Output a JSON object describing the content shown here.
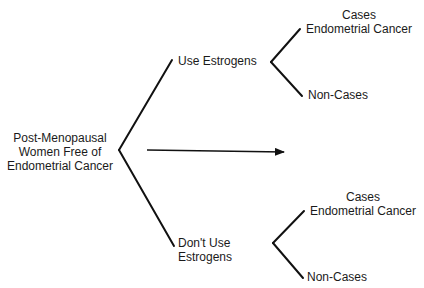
{
  "diagram": {
    "type": "tree",
    "root": {
      "label_lines": [
        "Post-Menopausal",
        "Women Free of",
        "Endometrial Cancer"
      ]
    },
    "arrow": {
      "meaning": "time / follow-up direction"
    },
    "branches": [
      {
        "label": "Use Estrogens",
        "outcomes": [
          {
            "label_lines": [
              "Cases",
              "Endometrial Cancer"
            ]
          },
          {
            "label_lines": [
              "Non-Cases"
            ]
          }
        ]
      },
      {
        "label_lines": [
          "Don't Use",
          "Estrogens"
        ],
        "outcomes": [
          {
            "label_lines": [
              "Cases",
              "Endometrial Cancer"
            ]
          },
          {
            "label_lines": [
              "Non-Cases"
            ]
          }
        ]
      }
    ],
    "colors": {
      "line": "#111111",
      "text": "#1a1a1a",
      "background": "#ffffff"
    }
  }
}
